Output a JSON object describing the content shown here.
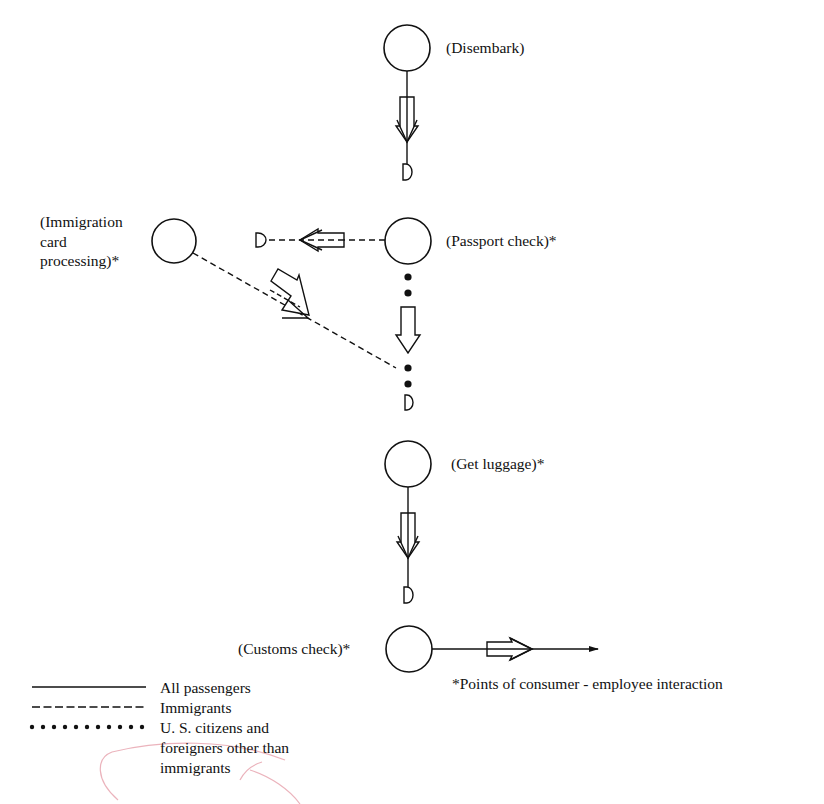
{
  "diagram": {
    "stroke_color": "#111111",
    "stamp_color": "#e59aa6",
    "nodes": [
      {
        "id": "disembark",
        "label": "(Disembark)",
        "cx": 407,
        "cy": 48,
        "r": 23,
        "interaction": false
      },
      {
        "id": "passport",
        "label": "(Passport check)*",
        "cx": 408,
        "cy": 241,
        "r": 23,
        "interaction": true
      },
      {
        "id": "immigration",
        "label": "(Immigration\ncard\nprocessing)*",
        "cx": 174,
        "cy": 241,
        "r": 22,
        "interaction": true
      },
      {
        "id": "luggage",
        "label": "(Get luggage)*",
        "cx": 408,
        "cy": 464,
        "r": 23,
        "interaction": true
      },
      {
        "id": "customs",
        "label": "(Customs check)*",
        "cx": 409,
        "cy": 649,
        "r": 23,
        "interaction": true
      }
    ],
    "edges": [
      {
        "from": "disembark",
        "to": "passport",
        "style": "solid",
        "legend": "All passengers"
      },
      {
        "from": "passport",
        "to": "immigration",
        "style": "dashed",
        "legend": "Immigrants"
      },
      {
        "from": "passport",
        "to": "luggage",
        "style": "dotted",
        "legend": "U. S. citizens and foreigners other than immigrants"
      },
      {
        "from": "immigration",
        "to": "luggage",
        "style": "dashed",
        "legend": "Immigrants"
      },
      {
        "from": "luggage",
        "to": "customs",
        "style": "solid",
        "legend": "All passengers"
      },
      {
        "from": "customs",
        "to": "exit",
        "style": "solid",
        "legend": "All passengers"
      }
    ],
    "delay_symbol": "D",
    "footnote": "*Points of consumer - employee interaction",
    "legend": [
      {
        "style": "solid",
        "label": "All passengers"
      },
      {
        "style": "dashed",
        "label": "Immigrants"
      },
      {
        "style": "dotted",
        "label": "U. S. citizens and\nforeigners other than\nimmigrants"
      }
    ]
  }
}
